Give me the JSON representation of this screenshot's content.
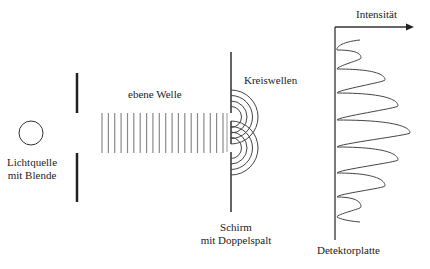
{
  "diagram": {
    "type": "double-slit experiment",
    "labels": {
      "source_line1": "Lichtquelle",
      "source_line2": "mit Blende",
      "plane_wave": "ebene Welle",
      "circular_waves": "Kreiswellen",
      "screen_line1": "Schirm",
      "screen_line2": "mit Doppelspalt",
      "detector": "Detektorplatte",
      "intensity_axis": "Intensität"
    },
    "colors": {
      "ink": "#222222",
      "wave_lines": "#8a8a8a",
      "background": "#ffffff"
    },
    "plane_wave_line_count": 20,
    "circular_wave_rings_per_slit": 4,
    "intensity_peaks": [
      {
        "y": 58,
        "x": 361
      },
      {
        "y": 80,
        "x": 385
      },
      {
        "y": 106,
        "x": 398
      },
      {
        "y": 133,
        "x": 410
      },
      {
        "y": 160,
        "x": 398
      },
      {
        "y": 186,
        "x": 385
      },
      {
        "y": 207,
        "x": 361
      }
    ]
  }
}
